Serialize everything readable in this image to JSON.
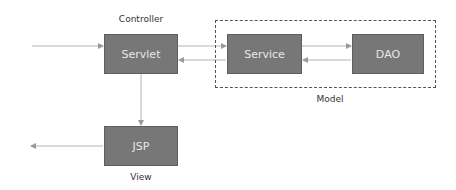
{
  "diagram": {
    "colors": {
      "box_fill": "#777777",
      "box_text": "#e8e8e8",
      "arrow": "#aaaaaa",
      "group_border": "#555555"
    },
    "groups": [
      {
        "id": "model",
        "label": "Model"
      }
    ],
    "nodes": [
      {
        "id": "servlet",
        "label": "Servlet",
        "caption": "Controller"
      },
      {
        "id": "service",
        "label": "Service"
      },
      {
        "id": "dao",
        "label": "DAO"
      },
      {
        "id": "jsp",
        "label": "JSP",
        "caption": "View"
      }
    ],
    "edges": [
      {
        "from": "external",
        "to": "servlet"
      },
      {
        "from": "servlet",
        "to": "service"
      },
      {
        "from": "service",
        "to": "servlet"
      },
      {
        "from": "service",
        "to": "dao"
      },
      {
        "from": "dao",
        "to": "service"
      },
      {
        "from": "servlet",
        "to": "jsp"
      },
      {
        "from": "jsp",
        "to": "external"
      }
    ]
  }
}
